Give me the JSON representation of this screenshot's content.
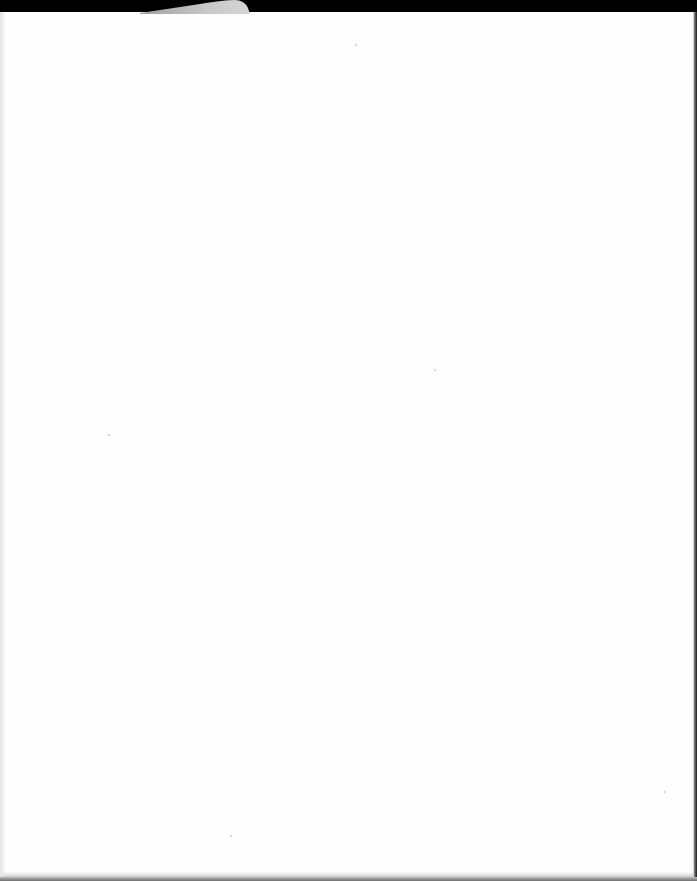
{
  "document": {
    "type": "scanned-page",
    "content": "",
    "colors": {
      "page": "#fefefe",
      "scanner_background": "#000000",
      "curl": "#c4c4c4",
      "edge_shadow": "#8a8a8a"
    }
  }
}
